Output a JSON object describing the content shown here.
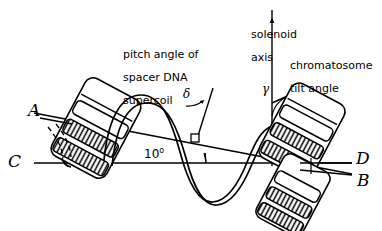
{
  "figure": {
    "type": "scientific-line-diagram",
    "background_color": "#ffffff",
    "ink_color": "#000000"
  },
  "labels": {
    "pitch_angle": {
      "line1": "pitch angle of",
      "line2": "spacer DNA",
      "line3": "supercoil"
    },
    "solenoid_axis": {
      "line1": "solenoid",
      "line2": "axis",
      "arrow_glyph": "arrow-up"
    },
    "chromatosome_tilt": {
      "line1": "chromatosome",
      "line2": "tilt angle"
    }
  },
  "axis_labels": {
    "a": "A",
    "b": "B",
    "c": "C",
    "d": "D"
  },
  "angles": {
    "ab_cd": "10",
    "degree_symbol": "o",
    "pitch_symbol": "δ",
    "tilt_symbol": "γ"
  }
}
